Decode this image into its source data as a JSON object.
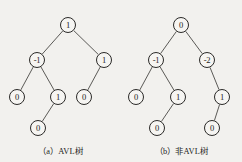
{
  "figure": {
    "width": 242,
    "height": 162,
    "background_color": "#f2f1ee",
    "line_color": "#4a4845",
    "node_stroke_color": "#2b2a28",
    "node_fill_color": "#f6f5f2",
    "text_color": "#1d1c1b"
  },
  "trees": [
    {
      "id": "tree-a",
      "caption": "（a）AVL树",
      "nodes": [
        {
          "name": "root",
          "label": "1",
          "x": 68,
          "y": 25
        },
        {
          "name": "left-child",
          "label": "-1",
          "x": 37,
          "y": 60
        },
        {
          "name": "right-child",
          "label": "1",
          "x": 104,
          "y": 60
        },
        {
          "name": "left-left",
          "label": "0",
          "x": 17,
          "y": 97
        },
        {
          "name": "left-right",
          "label": "1",
          "x": 58,
          "y": 97
        },
        {
          "name": "right-left",
          "label": "0",
          "x": 84,
          "y": 97
        },
        {
          "name": "left-right-left",
          "label": "0",
          "x": 38,
          "y": 128
        }
      ],
      "edges": [
        {
          "from": "root",
          "to": "left-child"
        },
        {
          "from": "root",
          "to": "right-child"
        },
        {
          "from": "left-child",
          "to": "left-left"
        },
        {
          "from": "left-child",
          "to": "left-right"
        },
        {
          "from": "right-child",
          "to": "right-left"
        },
        {
          "from": "left-right",
          "to": "left-right-left"
        }
      ]
    },
    {
      "id": "tree-b",
      "caption": "（b）非AVL树",
      "nodes": [
        {
          "name": "root",
          "label": "0",
          "x": 60,
          "y": 25
        },
        {
          "name": "left-child",
          "label": "-1",
          "x": 35,
          "y": 60
        },
        {
          "name": "right-child",
          "label": "-2",
          "x": 86,
          "y": 60
        },
        {
          "name": "left-left",
          "label": "0",
          "x": 15,
          "y": 97
        },
        {
          "name": "left-right",
          "label": "1",
          "x": 57,
          "y": 97
        },
        {
          "name": "right-right",
          "label": "1",
          "x": 101,
          "y": 97
        },
        {
          "name": "left-right-left",
          "label": "0",
          "x": 36,
          "y": 128
        },
        {
          "name": "right-right-left",
          "label": "0",
          "x": 91,
          "y": 128
        }
      ],
      "edges": [
        {
          "from": "root",
          "to": "left-child"
        },
        {
          "from": "root",
          "to": "right-child"
        },
        {
          "from": "left-child",
          "to": "left-left"
        },
        {
          "from": "left-child",
          "to": "left-right"
        },
        {
          "from": "right-child",
          "to": "right-right"
        },
        {
          "from": "left-right",
          "to": "left-right-left"
        },
        {
          "from": "right-right",
          "to": "right-right-left"
        }
      ]
    }
  ]
}
